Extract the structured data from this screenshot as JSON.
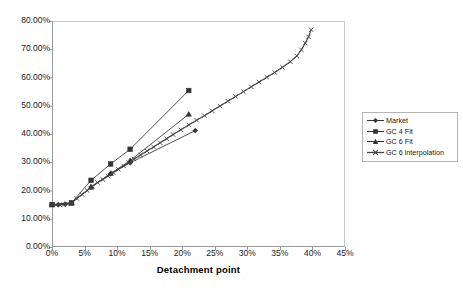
{
  "chart_data": {
    "type": "line",
    "title": "",
    "xlabel": "Detachment point",
    "ylabel": "",
    "xlim": [
      0,
      45
    ],
    "ylim": [
      0,
      80
    ],
    "x_tick_labels": [
      "0%",
      "5%",
      "10%",
      "15%",
      "20%",
      "25%",
      "30%",
      "35%",
      "40%",
      "45%"
    ],
    "x_tick_values": [
      0,
      5,
      10,
      15,
      20,
      25,
      30,
      35,
      40,
      45
    ],
    "y_tick_labels": [
      "0.00%",
      "10.00%",
      "20.00%",
      "30.00%",
      "40.00%",
      "50.00%",
      "60.00%",
      "70.00%",
      "80.00%"
    ],
    "y_tick_values": [
      0,
      10,
      20,
      30,
      40,
      50,
      60,
      70,
      80
    ],
    "grid": false,
    "legend_position": "right",
    "series": [
      {
        "name": "Market",
        "marker": "diamond",
        "color": "#333333",
        "points": [
          [
            0.0,
            15.0
          ],
          [
            1.0,
            15.0
          ],
          [
            2.0,
            15.2
          ],
          [
            3.0,
            15.6
          ],
          [
            6.0,
            21.2
          ],
          [
            9.0,
            26.0
          ],
          [
            12.0,
            29.8
          ],
          [
            22.0,
            41.2
          ]
        ]
      },
      {
        "name": "GC 4 Fit",
        "marker": "square",
        "color": "#333333",
        "points": [
          [
            0.0,
            15.0
          ],
          [
            3.0,
            15.6
          ],
          [
            6.0,
            23.6
          ],
          [
            9.0,
            29.4
          ],
          [
            12.0,
            34.6
          ],
          [
            21.0,
            55.4
          ]
        ]
      },
      {
        "name": "GC 6 Fit",
        "marker": "triangle",
        "color": "#333333",
        "points": [
          [
            0.0,
            15.0
          ],
          [
            3.0,
            15.6
          ],
          [
            6.0,
            21.2
          ],
          [
            9.0,
            26.0
          ],
          [
            12.0,
            30.6
          ],
          [
            21.0,
            47.0
          ]
        ]
      },
      {
        "name": "GC 6 interpolation",
        "marker": "cross",
        "color": "#444444",
        "points": [
          [
            0.0,
            14.9
          ],
          [
            0.6,
            14.9
          ],
          [
            1.2,
            14.9
          ],
          [
            1.8,
            15.0
          ],
          [
            2.4,
            15.2
          ],
          [
            3.0,
            15.6
          ],
          [
            3.8,
            17.2
          ],
          [
            4.6,
            18.6
          ],
          [
            5.4,
            20.0
          ],
          [
            6.2,
            21.5
          ],
          [
            7.0,
            22.8
          ],
          [
            7.8,
            23.9
          ],
          [
            8.6,
            25.1
          ],
          [
            9.4,
            26.3
          ],
          [
            10.2,
            27.5
          ],
          [
            11.0,
            28.7
          ],
          [
            11.8,
            29.9
          ],
          [
            12.6,
            31.1
          ],
          [
            13.6,
            32.6
          ],
          [
            14.6,
            34.0
          ],
          [
            15.6,
            35.4
          ],
          [
            16.6,
            36.9
          ],
          [
            17.6,
            38.3
          ],
          [
            18.6,
            39.8
          ],
          [
            19.8,
            41.5
          ],
          [
            21.0,
            43.2
          ],
          [
            22.2,
            44.9
          ],
          [
            23.4,
            46.5
          ],
          [
            24.6,
            48.2
          ],
          [
            25.8,
            49.9
          ],
          [
            27.0,
            51.6
          ],
          [
            28.2,
            53.3
          ],
          [
            29.4,
            55.0
          ],
          [
            30.6,
            56.7
          ],
          [
            31.8,
            58.4
          ],
          [
            33.0,
            60.1
          ],
          [
            34.2,
            61.8
          ],
          [
            35.4,
            63.6
          ],
          [
            36.6,
            65.6
          ],
          [
            37.6,
            67.6
          ],
          [
            38.3,
            69.8
          ],
          [
            38.9,
            72.2
          ],
          [
            39.4,
            74.4
          ],
          [
            39.8,
            76.9
          ]
        ]
      }
    ]
  },
  "legend": {
    "items": [
      {
        "label": "Market",
        "marker": "diamond"
      },
      {
        "label": "GC 4 Fit",
        "marker": "square"
      },
      {
        "label": "GC 6 Fit",
        "marker": "triangle"
      },
      {
        "label": "GC 6 interpolation",
        "marker": "cross"
      }
    ]
  }
}
